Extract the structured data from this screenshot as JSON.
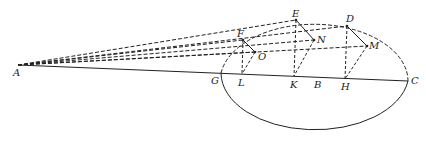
{
  "diagram": {
    "labels": {
      "A": "A",
      "G": "G",
      "L": "L",
      "K": "K",
      "B": "B",
      "H": "H",
      "C": "C",
      "F": "F",
      "E": "E",
      "D": "D",
      "O": "O",
      "N": "N",
      "M": "M"
    },
    "stroke_color": "#222222",
    "background": "#ffffff"
  }
}
